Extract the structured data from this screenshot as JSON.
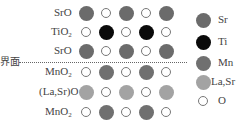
{
  "interface_label": "界面",
  "colors": {
    "Sr": "#6b6b6b",
    "Ti": "#0a0a0a",
    "Mn": "#707070",
    "LaSr": "#a3a3a3",
    "O_border": "#777777"
  },
  "rows": [
    {
      "label": "SrO",
      "sub": "",
      "label_after": "",
      "atoms": [
        "Sr",
        "O",
        "Sr",
        "O",
        "Sr"
      ]
    },
    {
      "label": "TiO",
      "sub": "2",
      "label_after": "",
      "atoms": [
        "O",
        "Ti",
        "O",
        "Ti",
        "O"
      ]
    },
    {
      "label": "SrO",
      "sub": "",
      "label_after": "",
      "atoms": [
        "Sr",
        "O",
        "Sr",
        "O",
        "Sr"
      ]
    },
    {
      "label": "MnO",
      "sub": "2",
      "label_after": "",
      "atoms": [
        "O",
        "Mn",
        "O",
        "Mn",
        "O"
      ]
    },
    {
      "label": "(La,Sr)O",
      "sub": "",
      "label_after": "",
      "atoms": [
        "LaSr",
        "O",
        "LaSr",
        "O",
        "LaSr"
      ]
    },
    {
      "label": "MnO",
      "sub": "2",
      "label_after": "",
      "atoms": [
        "O",
        "Mn",
        "O",
        "Mn",
        "O"
      ]
    }
  ],
  "legend": [
    {
      "key": "Sr",
      "label": "Sr"
    },
    {
      "key": "Ti",
      "label": "Ti"
    },
    {
      "key": "Mn",
      "label": "Mn"
    },
    {
      "key": "LaSr",
      "label": "La,Sr"
    },
    {
      "key": "O",
      "label": "O"
    }
  ]
}
